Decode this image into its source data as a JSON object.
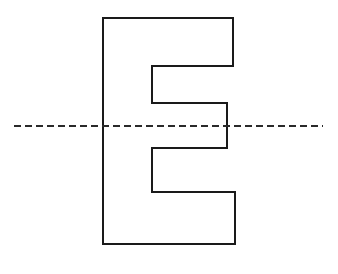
{
  "diagram": {
    "shape": {
      "name": "letter-e-outline",
      "stroke": "#1a1a1a",
      "fill": "none",
      "stroke_width": 2,
      "points": "103,18 233,18 233,66 152,66 152,103 227,103 227,148 152,148 152,192 235,192 235,244 103,244"
    },
    "dashed_line": {
      "name": "horizontal-dashed-line",
      "stroke": "#2a2a2a",
      "stroke_width": 2,
      "dasharray": "7 4",
      "x1": 14,
      "y1": 126,
      "x2": 323,
      "y2": 126
    }
  }
}
